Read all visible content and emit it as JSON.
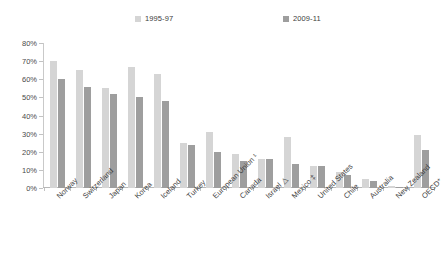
{
  "chart_data": {
    "type": "bar",
    "title": "",
    "subtitle": "",
    "xlabel": "",
    "ylabel": "",
    "ylim": [
      0,
      80
    ],
    "ytick_labels": [
      "80%",
      "70%",
      "60%",
      "50%",
      "40%",
      "30%",
      "20%",
      "10%",
      "0%"
    ],
    "ytick_values": [
      80,
      70,
      60,
      50,
      40,
      30,
      20,
      10,
      0
    ],
    "grid": false,
    "legend_position": "top",
    "categories": [
      "Norway",
      "Switzerland",
      "Japan",
      "Korea",
      "Iceland",
      "Turkey",
      "European Union ¹",
      "Canada",
      "Israel △",
      "Mexico ‡",
      "United States",
      "Chile",
      "Australia",
      "New Zealand",
      "OECD*"
    ],
    "series": [
      {
        "name": "1995-97",
        "color": "#d5d5d5",
        "values": [
          70,
          65,
          55,
          67,
          63,
          25,
          31,
          19,
          16,
          28,
          12,
          9,
          5,
          1,
          29
        ]
      },
      {
        "name": "2009-11",
        "color": "#9e9e9e",
        "values": [
          60,
          56,
          52,
          50,
          48,
          24,
          20,
          15,
          16,
          13,
          12,
          7,
          4,
          0.5,
          21
        ]
      }
    ]
  },
  "legend": {
    "entries": [
      {
        "label": "1995-97",
        "color": "#d5d5d5"
      },
      {
        "label": "2009-11",
        "color": "#9e9e9e"
      }
    ]
  }
}
